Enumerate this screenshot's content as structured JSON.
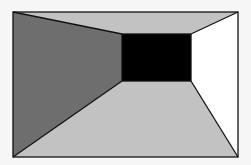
{
  "diagram": {
    "type": "one-point-perspective-room",
    "outer": {
      "x1": 13,
      "y1": 12,
      "x2": 238,
      "y2": 157
    },
    "inner": {
      "x1": 122,
      "y1": 34,
      "x2": 191,
      "y2": 81
    },
    "colors": {
      "background": "#f6f6f6",
      "left_wall": "#6e6e6e",
      "ceiling": "#c2c2c2",
      "floor": "#c2c2c2",
      "right_wall": "#ffffff",
      "back_wall": "#000000",
      "stroke": "#111111"
    }
  }
}
